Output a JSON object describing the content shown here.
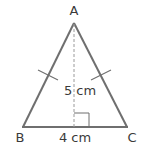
{
  "diagram": {
    "vertices": {
      "A": {
        "label": "A",
        "x": 74,
        "y": 23
      },
      "B": {
        "label": "B",
        "x": 23,
        "y": 127
      },
      "C": {
        "label": "C",
        "x": 127,
        "y": 127
      }
    },
    "base": {
      "label": "4 cm",
      "from": "B",
      "to": "C"
    },
    "height": {
      "label": "5 cm",
      "from": "A",
      "to": "foot",
      "style": "dashed"
    },
    "equal_sides": [
      "AB",
      "AC"
    ],
    "right_angle_marker": true,
    "colors": {
      "lines": "#6f6f6f",
      "dashed": "#9a9a9a",
      "text": "#3a3a3a"
    }
  }
}
